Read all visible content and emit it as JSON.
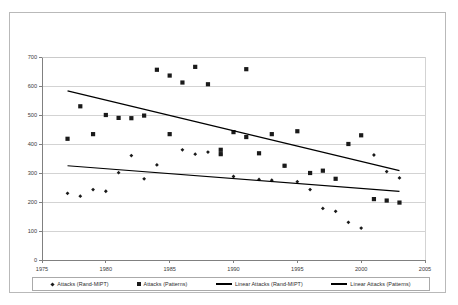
{
  "chart_data": {
    "type": "scatter",
    "title": "",
    "subtitle": "",
    "xlabel": "",
    "ylabel": "",
    "xlim": [
      1975,
      2005
    ],
    "ylim": [
      0,
      700
    ],
    "xticks": [
      1975,
      1980,
      1985,
      1990,
      1995,
      2000,
      2005
    ],
    "yticks": [
      0,
      100,
      200,
      300,
      400,
      500,
      600,
      700
    ],
    "grid": true,
    "legend_position": "bottom",
    "series": [
      {
        "name": "Attacks (Rand-MIPT)",
        "marker": "diamond",
        "color": "#1a1a1a",
        "points": [
          [
            1977,
            230
          ],
          [
            1978,
            220
          ],
          [
            1979,
            243
          ],
          [
            1980,
            237
          ],
          [
            1981,
            301
          ],
          [
            1982,
            360
          ],
          [
            1983,
            280
          ],
          [
            1984,
            328
          ],
          [
            1986,
            380
          ],
          [
            1987,
            365
          ],
          [
            1988,
            372
          ],
          [
            1989,
            365
          ],
          [
            1990,
            288
          ],
          [
            1992,
            278
          ],
          [
            1993,
            275
          ],
          [
            1994,
            325
          ],
          [
            1995,
            270
          ],
          [
            1996,
            243
          ],
          [
            1997,
            178
          ],
          [
            1998,
            168
          ],
          [
            1999,
            130
          ],
          [
            2000,
            110
          ],
          [
            2001,
            362
          ],
          [
            2002,
            305
          ],
          [
            2003,
            283
          ]
        ]
      },
      {
        "name": "Attacks (Patterns)",
        "marker": "square",
        "color": "#1a1a1a",
        "points": [
          [
            1977,
            418
          ],
          [
            1978,
            530
          ],
          [
            1979,
            434
          ],
          [
            1980,
            500
          ],
          [
            1981,
            490
          ],
          [
            1982,
            489
          ],
          [
            1983,
            498
          ],
          [
            1984,
            656
          ],
          [
            1985,
            636
          ],
          [
            1985,
            434
          ],
          [
            1986,
            612
          ],
          [
            1987,
            666
          ],
          [
            1988,
            606
          ],
          [
            1989,
            380
          ],
          [
            1989,
            365
          ],
          [
            1990,
            441
          ],
          [
            1991,
            658
          ],
          [
            1991,
            424
          ],
          [
            1992,
            368
          ],
          [
            1993,
            434
          ],
          [
            1994,
            325
          ],
          [
            1995,
            444
          ],
          [
            1996,
            300
          ],
          [
            1997,
            308
          ],
          [
            1998,
            280
          ],
          [
            1999,
            400
          ],
          [
            2000,
            430
          ],
          [
            2001,
            210
          ],
          [
            2002,
            205
          ],
          [
            2003,
            198
          ]
        ]
      }
    ],
    "trendlines": [
      {
        "name": "Linear Attacks (Rand-MIPT)",
        "color": "#000000",
        "x_start": 1977,
        "y_start": 325,
        "x_end": 2003,
        "y_end": 237
      },
      {
        "name": "Linear Attacks (Patterns)",
        "color": "#000000",
        "x_start": 1977,
        "y_start": 583,
        "x_end": 2003,
        "y_end": 308
      }
    ]
  },
  "legend": {
    "items": [
      {
        "label": "Attacks (Rand-MIPT)",
        "symbol": "diamond-marker"
      },
      {
        "label": "Attacks (Patterns)",
        "symbol": "square-marker"
      },
      {
        "label": "Linear Attacks (Rand-MIPT)",
        "symbol": "line-marker"
      },
      {
        "label": "Linear Attacks (Patterns)",
        "symbol": "line-marker"
      }
    ]
  }
}
